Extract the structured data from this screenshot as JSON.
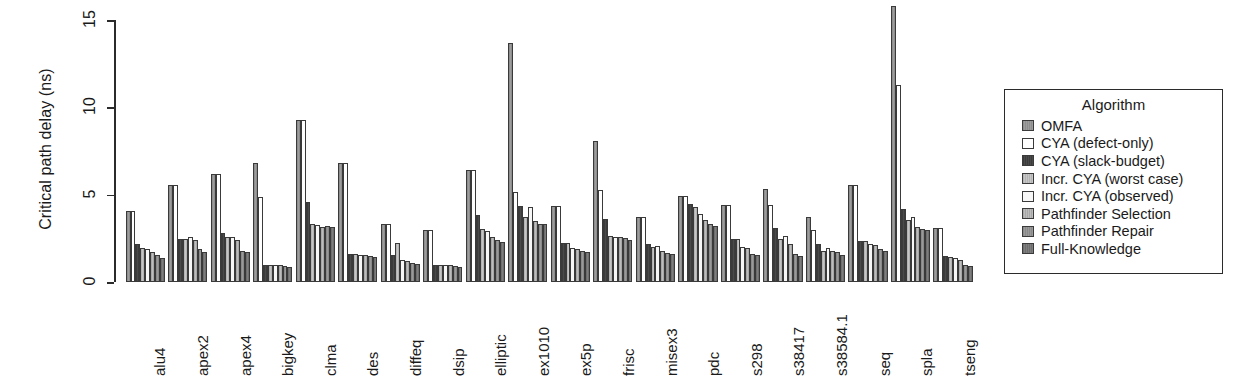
{
  "chart_data": {
    "type": "bar",
    "title": "",
    "xlabel": "",
    "ylabel": "Critical path delay (ns)",
    "ylim": [
      0,
      16.2
    ],
    "yticks": [
      0,
      5,
      10,
      15
    ],
    "ytick_labels": [
      "0",
      "5",
      "10",
      "15"
    ],
    "grid": false,
    "legend_title": "Algorithm",
    "legend_position": "right",
    "categories": [
      "alu4",
      "apex2",
      "apex4",
      "bigkey",
      "clma",
      "des",
      "diffeq",
      "dsip",
      "elliptic",
      "ex1010",
      "ex5p",
      "frisc",
      "misex3",
      "pdc",
      "s298",
      "s38417",
      "s38584.1",
      "seq",
      "spla",
      "tseng"
    ],
    "series": [
      {
        "name": "OMFA",
        "values": [
          4.05,
          5.55,
          6.2,
          6.8,
          9.25,
          6.8,
          3.3,
          3.0,
          6.4,
          13.7,
          4.35,
          8.1,
          3.75,
          4.95,
          4.4,
          5.3,
          3.7,
          5.55,
          15.8,
          3.1
        ]
      },
      {
        "name": "CYA (defect-only)",
        "values": [
          4.05,
          5.55,
          6.2,
          4.85,
          9.25,
          6.8,
          3.3,
          3.0,
          6.4,
          5.15,
          4.35,
          5.25,
          3.75,
          4.95,
          4.4,
          4.4,
          3.0,
          5.55,
          11.3,
          3.1
        ]
      },
      {
        "name": "CYA (slack-budget)",
        "values": [
          2.2,
          2.45,
          2.8,
          1.0,
          4.6,
          1.6,
          1.55,
          0.95,
          3.85,
          4.35,
          2.25,
          3.6,
          2.15,
          4.45,
          2.45,
          3.1,
          2.2,
          2.35,
          4.2,
          1.5
        ]
      },
      {
        "name": "Incr. CYA (worst case)",
        "values": [
          1.95,
          2.45,
          2.55,
          1.0,
          3.3,
          1.6,
          2.25,
          0.95,
          3.05,
          3.75,
          2.25,
          2.65,
          2.0,
          4.3,
          2.45,
          2.45,
          1.75,
          2.35,
          3.55,
          1.45
        ]
      },
      {
        "name": "Incr. CYA (observed)",
        "values": [
          1.9,
          2.55,
          2.6,
          1.0,
          3.25,
          1.55,
          1.25,
          0.95,
          2.9,
          4.3,
          1.95,
          2.6,
          2.05,
          3.9,
          2.0,
          2.65,
          1.95,
          2.2,
          3.75,
          1.4
        ]
      },
      {
        "name": "Pathfinder Selection",
        "values": [
          1.7,
          2.4,
          2.4,
          1.0,
          3.15,
          1.55,
          1.2,
          0.95,
          2.6,
          3.5,
          1.9,
          2.55,
          1.75,
          3.55,
          1.95,
          2.2,
          1.75,
          2.1,
          3.15,
          1.25
        ]
      },
      {
        "name": "Pathfinder Repair",
        "values": [
          1.55,
          1.9,
          1.8,
          0.9,
          3.2,
          1.5,
          1.1,
          0.9,
          2.4,
          3.35,
          1.75,
          2.5,
          1.65,
          3.35,
          1.6,
          1.6,
          1.7,
          1.9,
          3.05,
          1.0
        ]
      },
      {
        "name": "Full-Knowledge",
        "values": [
          1.35,
          1.7,
          1.7,
          0.85,
          3.15,
          1.45,
          1.05,
          0.85,
          2.3,
          3.3,
          1.7,
          2.4,
          1.6,
          3.2,
          1.55,
          1.5,
          1.55,
          1.8,
          2.95,
          0.9
        ]
      }
    ]
  },
  "legend": {
    "title": "Algorithm",
    "items": [
      {
        "label": "OMFA"
      },
      {
        "label": "CYA (defect-only)"
      },
      {
        "label": "CYA (slack-budget)"
      },
      {
        "label": "Incr. CYA (worst case)"
      },
      {
        "label": "Incr. CYA (observed)"
      },
      {
        "label": "Pathfinder Selection"
      },
      {
        "label": "Pathfinder Repair"
      },
      {
        "label": "Full-Knowledge"
      }
    ]
  }
}
